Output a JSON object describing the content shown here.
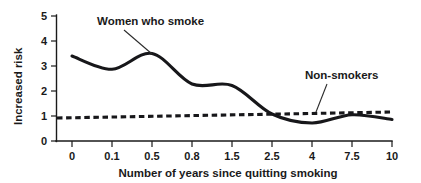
{
  "chart_data": {
    "type": "line",
    "title": "",
    "xlabel": "Number of years since quitting smoking",
    "ylabel": "Increased risk",
    "categories": [
      "0",
      "0.1",
      "0.5",
      "0.8",
      "1.5",
      "2.5",
      "4",
      "7.5",
      "10"
    ],
    "ylim": [
      0,
      5
    ],
    "yticks": [
      "0",
      "1",
      "2",
      "3",
      "4",
      "5"
    ],
    "grid": false,
    "legend_position": "inline-annotations",
    "series": [
      {
        "name": "Women who smoke",
        "style": "solid",
        "values": [
          3.4,
          2.87,
          3.5,
          2.28,
          2.22,
          1.08,
          0.72,
          1.05,
          0.86
        ]
      },
      {
        "name": "Non-smokers",
        "style": "dashed",
        "values": [
          0.92,
          0.95,
          0.98,
          1.0,
          1.03,
          1.07,
          1.1,
          1.14,
          1.16
        ]
      }
    ],
    "annotations": [
      {
        "text": "Women who smoke",
        "target_category": "0.5",
        "target_value": 3.5
      },
      {
        "text": "Non-smokers",
        "target_category": "4",
        "target_value": 1.1
      }
    ]
  },
  "axes": {
    "y_tick_0": "0",
    "y_tick_1": "1",
    "y_tick_2": "2",
    "y_tick_3": "3",
    "y_tick_4": "4",
    "y_tick_5": "5",
    "x_tick_0": "0",
    "x_tick_1": "0.1",
    "x_tick_2": "0.5",
    "x_tick_3": "0.8",
    "x_tick_4": "1.5",
    "x_tick_5": "2.5",
    "x_tick_6": "4",
    "x_tick_7": "7.5",
    "x_tick_8": "10",
    "x_axis_title": "Number of years since quitting smoking",
    "y_axis_title": "Increased risk"
  },
  "labels": {
    "smokers": "Women who smoke",
    "nonsmokers": "Non-smokers"
  },
  "colors": {
    "ink": "#17171a",
    "background": "#ffffff"
  }
}
